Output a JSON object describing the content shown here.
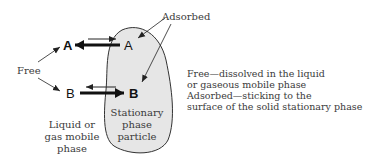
{
  "diagram": {
    "labels": {
      "adsorbed": "Adsorbed",
      "free": "Free",
      "species_a_free": "A",
      "species_a_adsorbed": "A",
      "species_b_free": "B",
      "species_b_adsorbed": "B",
      "mobile_phase": [
        "Liquid or",
        "gas mobile",
        "phase"
      ],
      "stationary_phase": [
        "Stationary",
        "phase",
        "particle"
      ]
    },
    "legend": [
      "Free—dissolved in the liquid",
      "or gaseous mobile phase",
      "Adsorbed—sticking to the",
      "surface of the solid stationary phase"
    ],
    "colors": {
      "particle_fill": "#e6e6e6",
      "stroke": "#222222",
      "text": "#3a3a3a"
    }
  }
}
